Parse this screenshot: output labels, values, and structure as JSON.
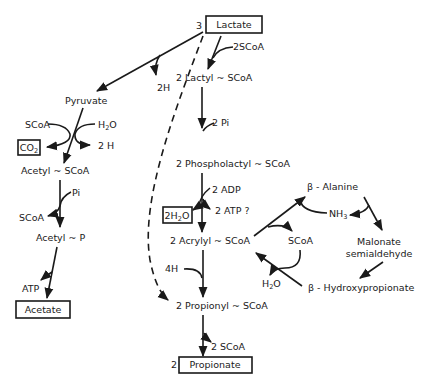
{
  "diagram": {
    "type": "metabolic-pathway",
    "nodes": {
      "lactate": {
        "coef": "3",
        "label": "Lactate"
      },
      "pyruvate": "Pyruvate",
      "lactyl_scoa": "2 Lactyl ~ SCoA",
      "phospholactyl_scoa": "2 Phospholactyl ~ SCoA",
      "acrylyl_scoa": "2 Acrylyl ~ SCoA",
      "propionyl_scoa": "2 Propionyl ~ SCoA",
      "propionate": {
        "coef": "2",
        "label": "Propionate"
      },
      "acetyl_scoa": "Acetyl ~ SCoA",
      "acetyl_p": "Acetyl ~ P",
      "acetate": "Acetate",
      "co2": "CO2",
      "h2o_box": "2H2O",
      "beta_alanine": "β - Alanine",
      "malonate_semialdehyde_1": "Malonate",
      "malonate_semialdehyde_2": "semialdehyde",
      "beta_hydroxypropionate": "β - Hydroxypropionate"
    },
    "cofactors": {
      "two_h_top": "2H",
      "two_scoa_top": "2SCoA",
      "scoa_pyruvate": "SCoA",
      "h2o_pyruvate": "H2O",
      "two_h_pyruvate": "2 H",
      "pi_acetyl": "Pi",
      "scoa_acetyl": "SCoA",
      "atp_acetate": "ATP",
      "two_pi": "2 Pi",
      "two_adp": "2 ADP",
      "two_atp": "2 ATP ?",
      "four_h": "4H",
      "two_scoa_bottom": "2 SCoA",
      "nh3": "NH3",
      "scoa_cycle": "SCoA",
      "h2o_cycle": "H2O"
    }
  }
}
